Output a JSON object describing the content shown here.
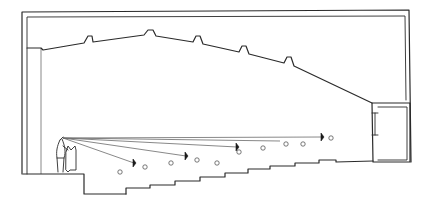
{
  "drawing": {
    "type": "architectural-section-sketch",
    "subject": "auditorium section with sight lines",
    "colors": {
      "ink": "#2a2a2a",
      "background": "#ffffff",
      "seat": "#555555"
    },
    "outer_frame": {
      "outer": [
        [
          22,
          12
        ],
        [
          409,
          10
        ],
        [
          411,
          162
        ]
      ],
      "inner": [
        [
          27,
          17
        ],
        [
          405,
          16
        ],
        [
          406,
          100
        ]
      ]
    },
    "left_wall": {
      "outer_x": 22,
      "inner_x": 27,
      "stage_wall_x": 41,
      "top": 12,
      "bottom": 174
    },
    "ceiling": {
      "points": [
        [
          27,
          48
        ],
        [
          41,
          48
        ],
        [
          43,
          50
        ],
        [
          84,
          43
        ],
        [
          88,
          36
        ],
        [
          92,
          36
        ],
        [
          93,
          42
        ],
        [
          144,
          35
        ],
        [
          148,
          30
        ],
        [
          153,
          30
        ],
        [
          156,
          36
        ],
        [
          193,
          42
        ],
        [
          196,
          36
        ],
        [
          200,
          36
        ],
        [
          203,
          44
        ],
        [
          239,
          52
        ],
        [
          242,
          46
        ],
        [
          246,
          46
        ],
        [
          249,
          54
        ],
        [
          284,
          63
        ],
        [
          287,
          57
        ],
        [
          291,
          57
        ],
        [
          294,
          66
        ],
        [
          372,
          103
        ]
      ]
    },
    "stage_floor": {
      "points": [
        [
          23,
          174
        ],
        [
          84,
          174
        ],
        [
          84,
          194
        ],
        [
          126,
          194
        ]
      ]
    },
    "stairs": {
      "points": [
        [
          126,
          194
        ],
        [
          126,
          188
        ],
        [
          150,
          188
        ],
        [
          150,
          185
        ],
        [
          175,
          185
        ],
        [
          175,
          181
        ],
        [
          200,
          181
        ],
        [
          200,
          177
        ],
        [
          225,
          177
        ],
        [
          225,
          173
        ],
        [
          248,
          173
        ],
        [
          248,
          169
        ],
        [
          270,
          169
        ],
        [
          270,
          166
        ],
        [
          295,
          166
        ],
        [
          295,
          163
        ],
        [
          319,
          163
        ],
        [
          319,
          160
        ],
        [
          336,
          160
        ],
        [
          336,
          162
        ],
        [
          373,
          161
        ]
      ]
    },
    "booth": {
      "outer": [
        [
          372,
          103
        ],
        [
          410,
          103
        ],
        [
          410,
          162
        ],
        [
          373,
          162
        ]
      ],
      "inner": [
        [
          378,
          107
        ],
        [
          407,
          107
        ],
        [
          407,
          160
        ],
        [
          378,
          160
        ]
      ],
      "window": {
        "x": 373,
        "y1": 113,
        "y2": 135
      }
    },
    "performer": {
      "eye": [
        63,
        138
      ]
    },
    "sight_lines": [
      {
        "to": [
          322,
          137
        ],
        "marker": [
          322,
          137
        ]
      },
      {
        "to": [
          280,
          141
        ]
      },
      {
        "to": [
          237,
          147
        ],
        "marker": [
          237,
          147
        ]
      },
      {
        "to": [
          186,
          156
        ],
        "marker": [
          186,
          156
        ]
      },
      {
        "to": [
          134,
          163
        ],
        "marker": [
          134,
          163
        ]
      }
    ],
    "seats": [
      [
        120,
        172
      ],
      [
        145,
        167
      ],
      [
        171,
        163
      ],
      [
        197,
        160
      ],
      [
        217,
        163
      ],
      [
        239,
        152
      ],
      [
        263,
        148
      ],
      [
        286,
        144
      ],
      [
        303,
        144
      ],
      [
        331,
        138
      ]
    ]
  }
}
